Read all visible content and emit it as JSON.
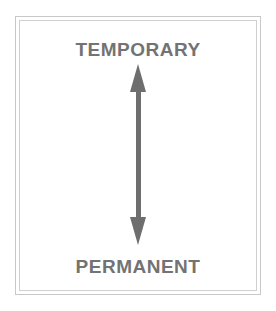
{
  "diagram": {
    "top_label": "TEMPORARY",
    "bottom_label": "PERMANENT",
    "arrow": {
      "type": "double-headed",
      "orientation": "vertical",
      "color": "#6e6e6e"
    },
    "text_color": "#737373",
    "border_color": "#c8c8c8"
  }
}
